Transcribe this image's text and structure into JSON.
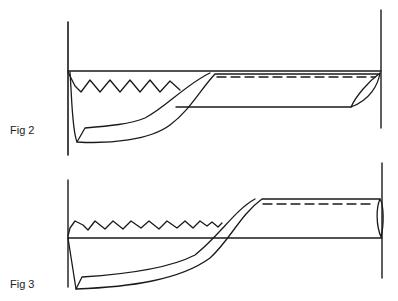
{
  "figures": [
    {
      "id": "fig2",
      "label": "Fig 2"
    },
    {
      "id": "fig3",
      "label": "Fig 3"
    }
  ],
  "colors": {
    "stroke": "#1a1a1a",
    "background": "#ffffff"
  }
}
